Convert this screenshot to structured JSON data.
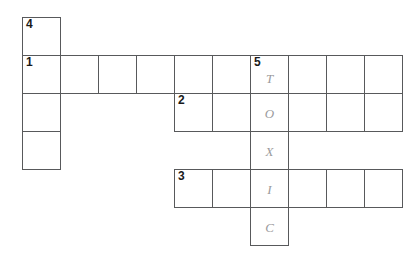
{
  "puzzle": {
    "type": "crossword-grid",
    "grid_origin": {
      "x": 22,
      "y": 17
    },
    "cell_size": 38,
    "columns": 10,
    "rows": 6,
    "border_color": "#58595b",
    "background_color": "#ffffff",
    "number_color": "#1a1a1a",
    "letter_color": "#9a9a9c",
    "answer_vertical": "TOXIC",
    "cells": [
      {
        "row": 0,
        "col": 0,
        "number": "4",
        "letter": ""
      },
      {
        "row": 1,
        "col": 0,
        "number": "1",
        "letter": ""
      },
      {
        "row": 1,
        "col": 1,
        "number": "",
        "letter": ""
      },
      {
        "row": 1,
        "col": 2,
        "number": "",
        "letter": ""
      },
      {
        "row": 1,
        "col": 3,
        "number": "",
        "letter": ""
      },
      {
        "row": 1,
        "col": 4,
        "number": "",
        "letter": ""
      },
      {
        "row": 1,
        "col": 5,
        "number": "",
        "letter": ""
      },
      {
        "row": 1,
        "col": 6,
        "number": "5",
        "letter": "T"
      },
      {
        "row": 1,
        "col": 7,
        "number": "",
        "letter": ""
      },
      {
        "row": 1,
        "col": 8,
        "number": "",
        "letter": ""
      },
      {
        "row": 1,
        "col": 9,
        "number": "",
        "letter": ""
      },
      {
        "row": 2,
        "col": 0,
        "number": "",
        "letter": ""
      },
      {
        "row": 2,
        "col": 4,
        "number": "2",
        "letter": ""
      },
      {
        "row": 2,
        "col": 5,
        "number": "",
        "letter": ""
      },
      {
        "row": 2,
        "col": 6,
        "number": "",
        "letter": "O"
      },
      {
        "row": 2,
        "col": 7,
        "number": "",
        "letter": ""
      },
      {
        "row": 2,
        "col": 8,
        "number": "",
        "letter": ""
      },
      {
        "row": 2,
        "col": 9,
        "number": "",
        "letter": ""
      },
      {
        "row": 3,
        "col": 0,
        "number": "",
        "letter": ""
      },
      {
        "row": 3,
        "col": 6,
        "number": "",
        "letter": "X"
      },
      {
        "row": 4,
        "col": 4,
        "number": "3",
        "letter": ""
      },
      {
        "row": 4,
        "col": 5,
        "number": "",
        "letter": ""
      },
      {
        "row": 4,
        "col": 6,
        "number": "",
        "letter": "I"
      },
      {
        "row": 4,
        "col": 7,
        "number": "",
        "letter": ""
      },
      {
        "row": 4,
        "col": 8,
        "number": "",
        "letter": ""
      },
      {
        "row": 4,
        "col": 9,
        "number": "",
        "letter": ""
      },
      {
        "row": 5,
        "col": 6,
        "number": "",
        "letter": "C"
      }
    ]
  }
}
